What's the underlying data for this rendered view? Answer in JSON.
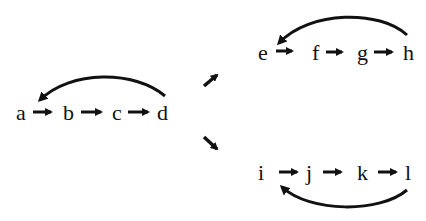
{
  "diagram": {
    "type": "cyclic sequences",
    "color": "#111111",
    "source_chain": {
      "nodes": [
        "a",
        "b",
        "c",
        "d"
      ],
      "cycle_arrow": {
        "from": "d",
        "to": "a",
        "position": "above"
      }
    },
    "branch_arrows": [
      {
        "direction": "up-right",
        "to_chain": "upper"
      },
      {
        "direction": "down-right",
        "to_chain": "lower"
      }
    ],
    "upper_chain": {
      "nodes": [
        "e",
        "f",
        "g",
        "h"
      ],
      "cycle_arrow": {
        "from": "h",
        "to": "e",
        "position": "above"
      }
    },
    "lower_chain": {
      "nodes": [
        "i",
        "j",
        "k",
        "l"
      ],
      "cycle_arrow": {
        "from": "l",
        "to": "i",
        "position": "below"
      }
    }
  }
}
